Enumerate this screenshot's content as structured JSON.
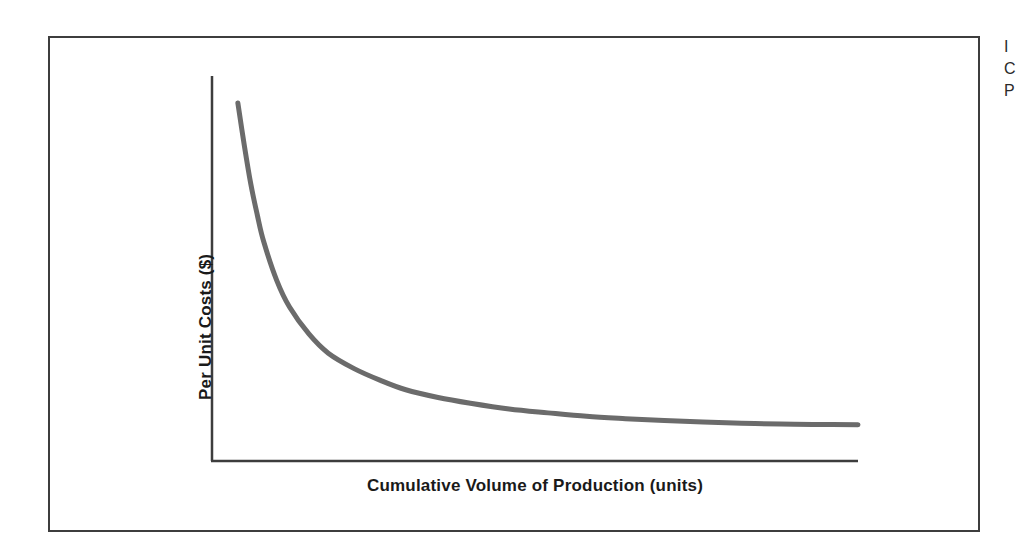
{
  "figure": {
    "background_color": "#ffffff",
    "frame_border_color": "#3d3d3d",
    "axis_color": "#3d3d3d",
    "curve_color": "#6b6b6b"
  },
  "axes": {
    "y_label_text": "Per Unit Costs (",
    "y_label_money": "$",
    "y_label_close": ")",
    "x_label": "Cumulative Volume of Production (units)"
  },
  "margin_caption": {
    "lines": [
      "I",
      "C",
      "P"
    ]
  },
  "chart_data": {
    "type": "line",
    "title": "",
    "subtitle": "",
    "xlabel": "Cumulative Volume of Production (units)",
    "ylabel": "Per Unit Costs ($)",
    "grid": false,
    "legend": false,
    "legend_position": "none",
    "xlim": [
      0,
      100
    ],
    "ylim": [
      0,
      100
    ],
    "x_tick_labels": [],
    "y_tick_labels": [],
    "annotations": [],
    "series": [
      {
        "name": "Experience curve",
        "color": "#6b6b6b",
        "line_width": 5,
        "x": [
          4,
          5,
          6,
          7,
          8,
          10,
          12,
          15,
          18,
          22,
          26,
          30,
          35,
          40,
          46,
          52,
          58,
          64,
          70,
          76,
          82,
          88,
          93,
          100
        ],
        "y": [
          93,
          82,
          72,
          64,
          57,
          47,
          40,
          33,
          28,
          24,
          21,
          18.5,
          16.5,
          15,
          13.5,
          12.5,
          11.6,
          11,
          10.5,
          10.1,
          9.8,
          9.6,
          9.5,
          9.4
        ]
      }
    ]
  }
}
